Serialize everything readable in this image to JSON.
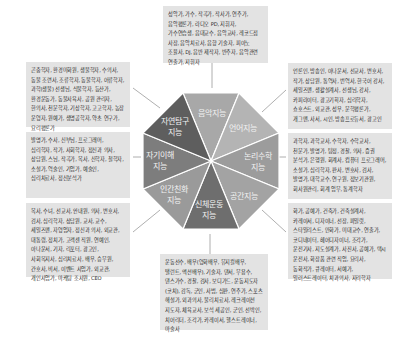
{
  "diagram": {
    "center_segments": [
      {
        "id": "music",
        "label": "음악지능",
        "color": "#a8a8a8"
      },
      {
        "id": "linguistic",
        "label": "언어지능",
        "color": "#b4b4b4"
      },
      {
        "id": "logical",
        "label": "논리수학\n지능",
        "color": "#9c9c9c"
      },
      {
        "id": "spatial",
        "label": "공간지능",
        "color": "#a3a3a3"
      },
      {
        "id": "bodily",
        "label": "신체운동\n지능",
        "color": "#6e6e6e"
      },
      {
        "id": "interpersonal",
        "label": "인간친화\n지능",
        "color": "#9a9a9a"
      },
      {
        "id": "intrapersonal",
        "label": "자기이해\n지능",
        "color": "#7d7d7d"
      },
      {
        "id": "naturalist",
        "label": "자연탐구\n지능",
        "color": "#5e5e5e"
      }
    ],
    "boxes": {
      "music": "성악가, 가수, 작곡가, 작사가, 연주가, 음악평론가, 라디오 PD, 지휘자, 가수연습생, 음대교수, 음악교사, 레코드점 사장, 음악치료사, 음향 기술자, 피아노 조율사, DJ, 음반 제작자, 반주자, 음악관련 연출가, 지휘자",
      "linguistic": "언론인, 방송인, 아나운서, 선교사, 변호사, 작가, 상담원, 통역사, 번역사, 한국어 강사, 세일즈맨, 생활설계사, 선생님, 강사, 카피라이터, 광고기획자, 심리학자, 쇼호스트, 외교관, 성우, 문학평론가, 개그맨, 사서, 시인, 방송프로듀서, 광고인",
      "logical": "과학자, 과학교사, 수학자, 수학교사, 천문가, 발명가, 탐정, 경찰, 의사, 증권 분석가, 은행원, 회계사, 컴퓨터 프로그래머, 소설가, 심리학자, 판사, 변호사, 검사, 발명가, 대학교수, 연구원, 정보기관원, 회사원관리, 회계 업무, 통계학자",
      "spatial": "화가, 공예가, 건축가, 건축설계사, 카레이서, 디자이너, 선장, 파일럿, 스타일리스트, 만화가, 미대교수, 연출가, 코디네이터, 헤어디자이너, 조각가, 운전기사, 지도설계가, 사진사, 공예가, 택시 운전사, 화장품 관련 직업, 요리사, 동화작가, 큐레이터, 서예가, 일러스트레이터, 치과의사, 지리학자",
      "bodily": "운동선수, 배우(영화배우, 뮤지컬배우, 탤런트, 액션배우), 기술자, 댄서, 무용수, 댄스가수, 경찰, 검사, 보디가드, 운동지도자(코치), 감독, 군인, 사범, 심판, 연주가, 스포츠 해설가, 외과의사, 물리치료사, 레크레이션 지도자, 체육교사, 보석 세공인, 군인, 선박인, 치어리더, 조각가, 카레이서, 헬스트레이너, 마술사",
      "interpersonal": "목사, 수녀, 선교사, 안내원, 의사, 변호사, 검사, 심리학자, 상담원, 교사, 교수, 세일즈맨, 자영업자, 정신과 의사, 외교관, 대통령, 정치가, 고객센 직원, 연예인, 아나운서, 기자, 리포터, 광고인, 사회복지사, 심리치료사, 배우, 승무원, 간호사, 비서, 이벤트 사업가, 외교관, 개인사업가, 마케팅 조사원, CEO",
      "intrapersonal": "발명가, 수사, 신부님, 프로그래머, 심리학자, 작가, 사회학자, 정신과 의사, 상담원, 스님, 작곡가, 목사, 신학자, 철학자, 소설가, 역술인, 기업가, 예술인, 심리치료사, 정신분석가",
      "naturalist": "곤충학자, 환경미화원, 생물학자, 수의사, 동물 조련사, 조류학자, 동물학자, 어류학자, 과학(생물) 선생님, 식물학자, 등산가, 환경운동가, 동물사육사, 공원 관리자, 한의사, 천문학자, 기상학자, 고고학자, 농장 운영자, 원예가, 생명공학자, 약초 연구가, 요리평론가"
    }
  }
}
